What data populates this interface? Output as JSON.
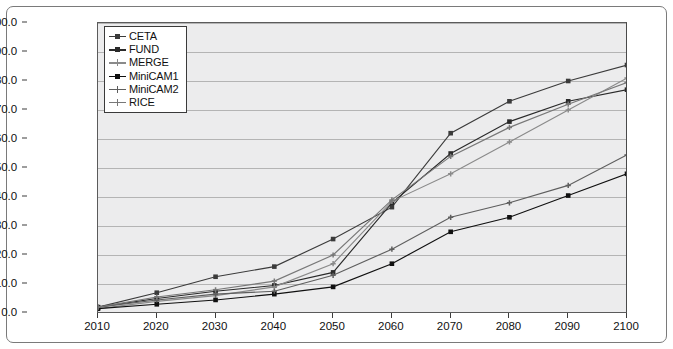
{
  "chart_data": {
    "type": "line",
    "title": "",
    "xlabel": "",
    "ylabel": "Reductions relative to the baseline (%)",
    "x": [
      2010,
      2020,
      2030,
      2040,
      2050,
      2060,
      2070,
      2080,
      2090,
      2100
    ],
    "xtick_labels": [
      "2010",
      "2020",
      "2030",
      "2040",
      "2050",
      "2060",
      "2070",
      "2080",
      "2090",
      "2100"
    ],
    "ytick_labels": [
      "0.0",
      "10.0",
      "20.0",
      "30.0",
      "40.0",
      "50.0",
      "60.0",
      "70.0",
      "80.0",
      "90.0",
      "100.0"
    ],
    "ytick_values": [
      0,
      10,
      20,
      30,
      40,
      50,
      60,
      70,
      80,
      90,
      100
    ],
    "xlim": [
      2010,
      2100
    ],
    "ylim": [
      0,
      100
    ],
    "grid": "horizontal",
    "legend_position": "top-left-inside",
    "plot_background": "#ececed",
    "series": [
      {
        "name": "CETA",
        "color": "#3b3b3b",
        "marker": "square",
        "values": [
          2.0,
          7.0,
          12.5,
          16.0,
          25.5,
          36.5,
          62.0,
          73.0,
          80.0,
          85.5
        ]
      },
      {
        "name": "FUND",
        "color": "#2a2a2a",
        "marker": "square",
        "values": [
          2.0,
          5.0,
          7.5,
          9.5,
          14.0,
          38.0,
          55.0,
          66.0,
          73.0,
          77.0
        ]
      },
      {
        "name": "MERGE",
        "color": "#8a8a8a",
        "marker": "cross",
        "values": [
          1.5,
          4.0,
          6.0,
          9.0,
          17.0,
          38.5,
          48.0,
          59.0,
          70.0,
          81.0
        ]
      },
      {
        "name": "MiniCAM1",
        "color": "#101010",
        "marker": "square",
        "values": [
          1.5,
          3.0,
          4.5,
          6.5,
          9.0,
          17.0,
          28.0,
          33.0,
          40.5,
          48.0
        ]
      },
      {
        "name": "MiniCAM2",
        "color": "#5e5e5e",
        "marker": "cross",
        "values": [
          2.0,
          4.5,
          6.5,
          7.5,
          13.0,
          22.0,
          33.0,
          38.0,
          44.0,
          54.5
        ]
      },
      {
        "name": "RICE",
        "color": "#787878",
        "marker": "cross",
        "values": [
          2.0,
          5.5,
          8.0,
          11.0,
          20.0,
          39.0,
          54.0,
          64.0,
          72.0,
          79.5
        ]
      }
    ]
  }
}
